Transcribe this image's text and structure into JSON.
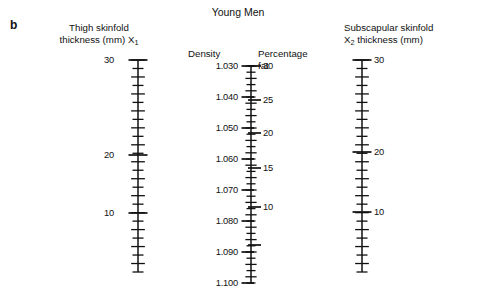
{
  "figure": {
    "panel_letter": "b",
    "title": "Young Men",
    "background": "#ffffff",
    "ink_color": "#111111",
    "width": 482,
    "height": 299
  },
  "chart_data": {
    "type": "nomogram",
    "title": "Young Men",
    "panel": "b",
    "axes": [
      {
        "id": "thigh",
        "name": "thigh-skinfold-scale",
        "title_lines": [
          "Thigh skinfold",
          "thickness (mm) X₁"
        ],
        "variable": "X1",
        "units": "mm",
        "label_side": "left",
        "axis_top_value": 30,
        "axis_bottom_value": 5,
        "major_ticks": [
          30,
          20,
          10
        ],
        "major_labels": [
          "30",
          "20",
          "10"
        ],
        "minor_tick_step": 1,
        "tick_values": [
          30,
          29,
          28,
          27,
          26,
          25,
          24,
          23,
          22,
          21,
          20,
          19,
          18,
          17,
          16,
          15,
          14,
          13,
          12,
          11,
          10,
          9,
          8,
          7,
          6,
          5
        ],
        "scale": "linear"
      },
      {
        "id": "density",
        "name": "density-scale",
        "title_lines": [
          "Density"
        ],
        "variable": "Density",
        "units": "",
        "label_side": "left",
        "axis_top_value": 1.03,
        "axis_bottom_value": 1.1,
        "major_ticks": [
          1.03,
          1.04,
          1.05,
          1.06,
          1.07,
          1.08,
          1.09,
          1.1
        ],
        "major_labels": [
          "1.030",
          "1.040",
          "1.050",
          "1.060",
          "1.070",
          "1.080",
          "1.090",
          "1.100"
        ],
        "minor_tick_step": 0.002,
        "scale": "linear"
      },
      {
        "id": "percentage_fat",
        "name": "percentage-fat-scale",
        "title_lines": [
          "Percentage",
          "fat"
        ],
        "variable": "Percentage fat",
        "units": "%",
        "label_side": "right",
        "axis_top_value": 30,
        "axis_bottom_value": 5,
        "major_ticks": [
          30,
          25,
          20,
          15,
          10,
          5
        ],
        "major_labels": [
          "30",
          "25",
          "20",
          "15",
          "10",
          ""
        ],
        "minor_tick_step": 1,
        "scale": "nonlinear-paired-with-density"
      },
      {
        "id": "subscapular",
        "name": "subscapular-skinfold-scale",
        "title_lines": [
          "Subscapular skinfold",
          "X₂ thickness (mm)"
        ],
        "variable": "X2",
        "units": "mm",
        "label_side": "right",
        "axis_top_value": 30,
        "axis_bottom_value": 5,
        "major_ticks": [
          30,
          20,
          10
        ],
        "major_labels": [
          "30",
          "20",
          "10"
        ],
        "minor_tick_step": 1,
        "scale": "nonlinear"
      }
    ],
    "series": [
      {
        "name": "Thigh skinfold thickness (mm) X1",
        "tick_values": [
          30,
          20,
          10
        ],
        "range": [
          5,
          30
        ]
      },
      {
        "name": "Density",
        "tick_values": [
          1.03,
          1.04,
          1.05,
          1.06,
          1.07,
          1.08,
          1.09,
          1.1
        ],
        "range": [
          1.03,
          1.1
        ]
      },
      {
        "name": "Percentage fat",
        "tick_values": [
          30,
          25,
          20,
          15,
          10,
          5
        ],
        "range": [
          5,
          30
        ]
      },
      {
        "name": "Subscapular skinfold thickness (mm) X2",
        "tick_values": [
          30,
          20,
          10
        ],
        "range": [
          5,
          30
        ]
      }
    ],
    "legend": [],
    "grid": false
  },
  "labels": {
    "thigh_title_l1": "Thigh skinfold",
    "thigh_title_l2_a": "thickness (mm) X",
    "thigh_title_l2_sub": "1",
    "density_title": "Density",
    "pctfat_title_l1": "Percentage",
    "pctfat_title_l2": "fat",
    "subscap_title_l1": "Subscapular skinfold",
    "subscap_title_l2_a": "X",
    "subscap_title_l2_sub": "2",
    "subscap_title_l2_b": " thickness (mm)"
  },
  "thigh_ticks": [
    {
      "value": "30",
      "y": 60,
      "major": true
    },
    {
      "value": "20",
      "y": 155,
      "major": true
    },
    {
      "value": "10",
      "y": 213,
      "major": true
    }
  ],
  "density_ticks": [
    {
      "value": "1.030",
      "y": 66
    },
    {
      "value": "1.040",
      "y": 97
    },
    {
      "value": "1.050",
      "y": 128
    },
    {
      "value": "1.060",
      "y": 159
    },
    {
      "value": "1.070",
      "y": 190
    },
    {
      "value": "1.080",
      "y": 221
    },
    {
      "value": "1.090",
      "y": 252
    },
    {
      "value": "1.100",
      "y": 283
    }
  ],
  "pctfat_ticks": [
    {
      "value": "30",
      "y": 66
    },
    {
      "value": "25",
      "y": 100
    },
    {
      "value": "20",
      "y": 133
    },
    {
      "value": "15",
      "y": 168
    },
    {
      "value": "10",
      "y": 207
    },
    {
      "value": "",
      "y": 245
    }
  ],
  "subscap_ticks": [
    {
      "value": "30",
      "y": 60,
      "major": true
    },
    {
      "value": "20",
      "y": 152,
      "major": true
    },
    {
      "value": "10",
      "y": 212,
      "major": true
    }
  ]
}
